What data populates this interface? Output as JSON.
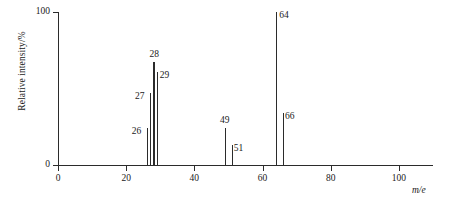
{
  "chart_data": {
    "type": "bar",
    "title": "",
    "subtitle": "",
    "xlabel": "m/e",
    "ylabel": "Relative intensity/%",
    "xlim": [
      0,
      110
    ],
    "ylim": [
      0,
      100
    ],
    "grid": false,
    "legend": null,
    "x_ticks": [
      0,
      20,
      40,
      60,
      80,
      100
    ],
    "x_tick_labels": [
      "0",
      "20",
      "40",
      "60",
      "80",
      "100"
    ],
    "y_ticks": [
      0,
      100
    ],
    "y_tick_labels": [
      "0",
      "100"
    ],
    "categories": [
      26,
      27,
      28,
      29,
      49,
      51,
      64,
      66
    ],
    "values": [
      24,
      47,
      67,
      61,
      24,
      13,
      100,
      34
    ],
    "point_labels": [
      "26",
      "27",
      "28",
      "29",
      "49",
      "51",
      "64",
      "66"
    ],
    "series": [
      {
        "name": "Relative intensity",
        "points": [
          {
            "mass": 26,
            "label": "26",
            "intensity": 24
          },
          {
            "mass": 27,
            "label": "27",
            "intensity": 47
          },
          {
            "mass": 28,
            "label": "28",
            "intensity": 67
          },
          {
            "mass": 29,
            "label": "29",
            "intensity": 61
          },
          {
            "mass": 49,
            "label": "49",
            "intensity": 24
          },
          {
            "mass": 51,
            "label": "51",
            "intensity": 13
          },
          {
            "mass": 64,
            "label": "64",
            "intensity": 100
          },
          {
            "mass": 66,
            "label": "66",
            "intensity": 34
          }
        ]
      }
    ],
    "colors": {
      "axis": "#2b2b2b",
      "peak": "#2b2b2b",
      "text": "#1a1a1a",
      "background": "#ffffff"
    }
  }
}
